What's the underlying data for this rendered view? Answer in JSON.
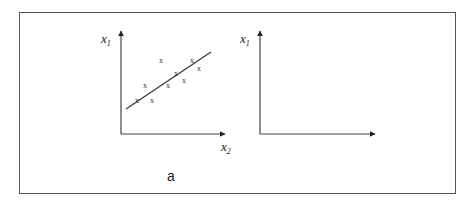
{
  "diagram": {
    "panels": [
      {
        "id": "a",
        "label": "a",
        "x_axis": "x",
        "x_axis_sub": "2",
        "y_axis": "x",
        "y_axis_sub": "1",
        "point_marker": "x",
        "fit": "regression-line"
      },
      {
        "id": "b",
        "label": "b",
        "x_axis": "x",
        "x_axis_sub": "2",
        "y_axis": "x",
        "y_axis_sub": "1",
        "point_marker": "x",
        "fit": "ellipse"
      }
    ]
  }
}
